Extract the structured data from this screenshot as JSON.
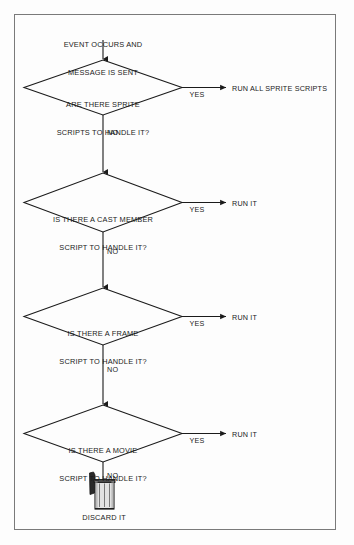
{
  "diagram": {
    "type": "flowchart",
    "frame": {
      "border_color": "#7a7a7a",
      "background": "#fdfdfd"
    },
    "line_color": "#1b1b1b",
    "text_color": "#1b1b1b",
    "start": {
      "name": "start-label",
      "line1": "EVENT OCCURS AND",
      "line2": "MESSAGE IS SENT"
    },
    "decisions": [
      {
        "id": "sprite",
        "line1": "ARE THERE SPRITE",
        "line2": "SCRIPTS TO HANDLE IT?",
        "yes_label": "YES",
        "no_label": "NO",
        "yes_target": "RUN ALL SPRITE SCRIPTS"
      },
      {
        "id": "cast-member",
        "line1": "IS THERE A CAST MEMBER",
        "line2": "SCRIPT TO HANDLE IT?",
        "yes_label": "YES",
        "no_label": "NO",
        "yes_target": "RUN IT"
      },
      {
        "id": "frame",
        "line1": "IS THERE A FRAME",
        "line2": "SCRIPT TO HANDLE IT?",
        "yes_label": "YES",
        "no_label": "NO",
        "yes_target": "RUN IT"
      },
      {
        "id": "movie",
        "line1": "IS THERE A MOVIE",
        "line2": "SCRIPT TO HANDLE IT?",
        "yes_label": "YES",
        "no_label": "NO",
        "yes_target": "RUN IT"
      }
    ],
    "end": {
      "icon": "trash-can-icon",
      "label": "DISCARD IT"
    }
  }
}
